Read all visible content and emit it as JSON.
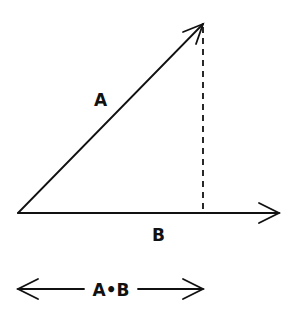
{
  "diagram": {
    "vectors": {
      "a": {
        "label": "A",
        "from": [
          18,
          213
        ],
        "to": [
          203,
          23
        ]
      },
      "b": {
        "label": "B",
        "from": [
          18,
          213
        ],
        "to": [
          278,
          213
        ]
      }
    },
    "projection_line": {
      "style": "dashed",
      "from": [
        203,
        25
      ],
      "to": [
        203,
        213
      ]
    },
    "dot_product": {
      "label": "A•B",
      "from": [
        18,
        289
      ],
      "to": [
        203,
        289
      ]
    },
    "colors": {
      "stroke": "#111111",
      "background": "#ffffff"
    }
  }
}
